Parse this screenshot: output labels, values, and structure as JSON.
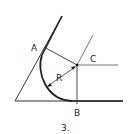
{
  "diagram": {
    "type": "geometric-construction",
    "labels": {
      "a": "A",
      "b": "B",
      "c": "C",
      "r": "R",
      "figure_number": "3."
    },
    "points": {
      "A": [
        42,
        50
      ],
      "B": [
        77,
        101
      ],
      "C": [
        77,
        65
      ]
    },
    "colors": {
      "line": "#222222",
      "background": "#ffffff"
    }
  }
}
